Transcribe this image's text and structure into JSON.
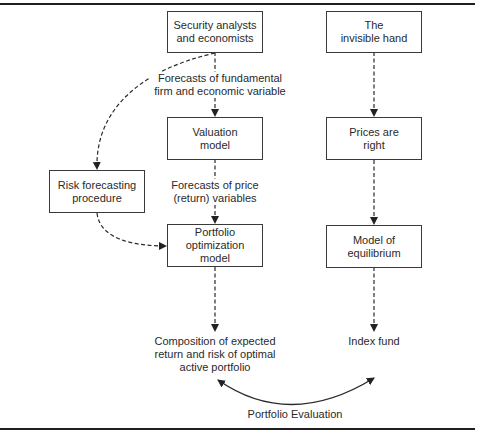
{
  "diagram": {
    "nodes": {
      "security_analysts": {
        "label": "Security analysts\nand economists"
      },
      "invisible_hand": {
        "label": "The\ninvisible hand"
      },
      "valuation_model": {
        "label": "Valuation\nmodel"
      },
      "prices_right": {
        "label": "Prices are\nright"
      },
      "risk_forecasting": {
        "label": "Risk forecasting\nprocedure"
      },
      "portfolio_optimization": {
        "label": "Portfolio\noptimization\nmodel"
      },
      "model_equilibrium": {
        "label": "Model of\nequilibrium"
      }
    },
    "edge_labels": {
      "fundamental_forecasts": "Forecasts of fundamental\nfirm and economic variable",
      "price_forecasts": "Forecasts of price\n(return) variables"
    },
    "outputs": {
      "active_portfolio": "Composition of expected\nreturn and risk of optimal\nactive portfolio",
      "index_fund": "Index fund"
    },
    "evaluation_label": "Portfolio Evaluation",
    "colors": {
      "line": "#2a2a2a",
      "box_border": "#3a3a3a",
      "rule": "#1f1f1f"
    }
  }
}
